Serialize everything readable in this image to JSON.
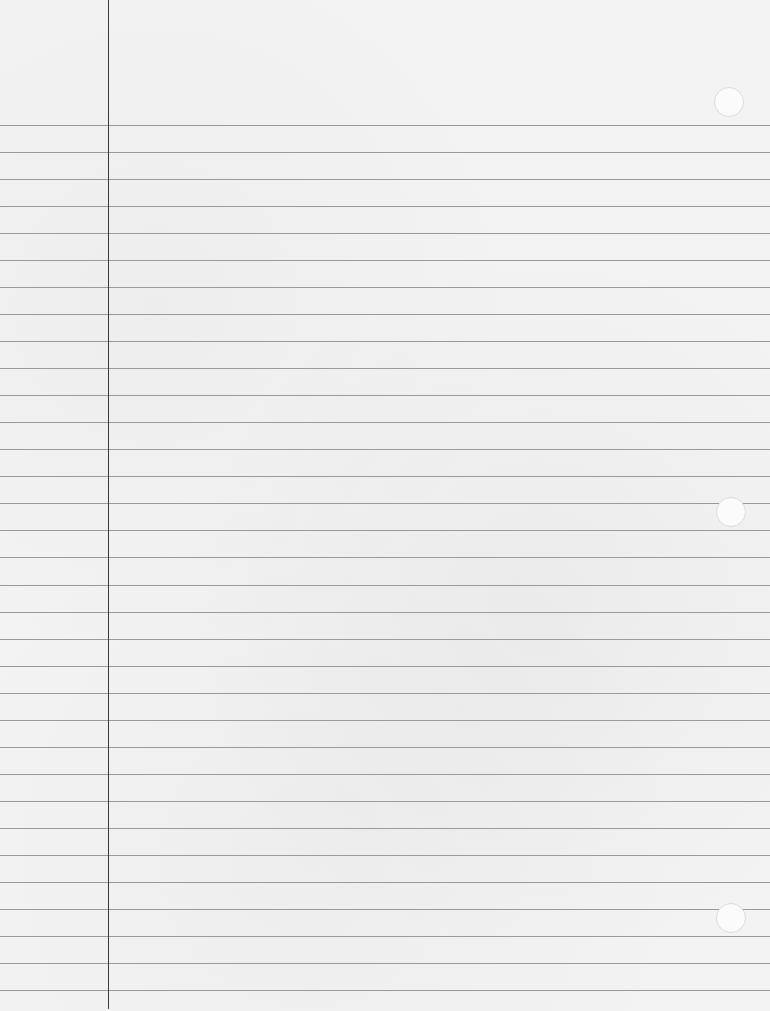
{
  "paper": {
    "title": "Lined notebook paper",
    "rule_count": 33,
    "first_rule_y": 125,
    "rule_spacing": 27.03,
    "rule_color": "#9a9a9a",
    "margin_line_x": 108,
    "margin_line_color": "#3a3a3a",
    "background_color": "#f3f3f3",
    "holes": [
      {
        "cx": 729,
        "cy": 102,
        "r": 15
      },
      {
        "cx": 731,
        "cy": 512,
        "r": 15
      },
      {
        "cx": 731,
        "cy": 918,
        "r": 15
      }
    ]
  }
}
